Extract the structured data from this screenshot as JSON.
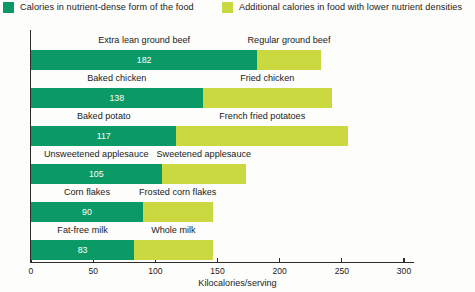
{
  "legend": {
    "entries": [
      {
        "label": "Calories in nutrient-dense form of the food",
        "color": "#0b9a66",
        "icon": "legend-swatch-icon"
      },
      {
        "label": "Additional calories in food with lower nutrient densities",
        "color": "#c9d93f",
        "icon": "legend-swatch-icon"
      }
    ]
  },
  "colors": {
    "nutrient_dense": "#0b9a66",
    "additional": "#c9d93f",
    "axis": "#2b2b2b",
    "text": "#222222",
    "value_text": "#ffffff",
    "background": "#fdfdfb"
  },
  "chart_data": {
    "type": "bar",
    "orientation": "horizontal",
    "stacked": true,
    "title": "",
    "subtitle": "",
    "xlabel": "Kilocalories/serving",
    "ylabel": "",
    "xlim": [
      0,
      300
    ],
    "xticks": [
      0,
      50,
      100,
      150,
      200,
      250,
      300
    ],
    "xticklabels": [
      "0",
      "50",
      "100",
      "150",
      "200",
      "250",
      "300"
    ],
    "grid": false,
    "legend_position": "top",
    "series": [
      {
        "name": "Calories in nutrient-dense form of the food",
        "color": "#0b9a66",
        "values": [
          182,
          138,
          117,
          105,
          90,
          83
        ]
      },
      {
        "name": "Additional calories in food with lower nutrient densities",
        "color": "#c9d93f",
        "values": [
          51,
          104,
          138,
          68,
          56,
          63
        ]
      }
    ],
    "rows": [
      {
        "dense_label": "Extra lean ground beef",
        "dense_value": 182,
        "dense_value_text": "182",
        "lower_label": "Regular ground beef",
        "total": 233
      },
      {
        "dense_label": "Baked chicken",
        "dense_value": 138,
        "dense_value_text": "138",
        "lower_label": "Fried chicken",
        "total": 242
      },
      {
        "dense_label": "Baked potato",
        "dense_value": 117,
        "dense_value_text": "117",
        "lower_label": "French fried potatoes",
        "total": 255
      },
      {
        "dense_label": "Unsweetened applesauce",
        "dense_value": 105,
        "dense_value_text": "105",
        "lower_label": "Sweetened applesauce",
        "total": 173
      },
      {
        "dense_label": "Corn flakes",
        "dense_value": 90,
        "dense_value_text": "90",
        "lower_label": "Frosted corn flakes",
        "total": 146
      },
      {
        "dense_label": "Fat-free milk",
        "dense_value": 83,
        "dense_value_text": "83",
        "lower_label": "Whole milk",
        "total": 146
      }
    ]
  }
}
